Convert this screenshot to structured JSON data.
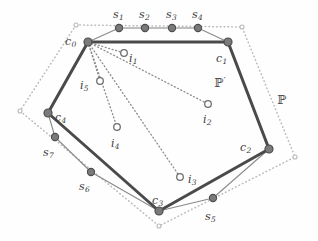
{
  "figure": {
    "colors": {
      "outer_polygon_dots": "#b9b9b9",
      "inner_polygon_stroke": "#4a4a4a",
      "thin_chain_stroke": "#8a8a8a",
      "vertex_fill": "#7a7a7a",
      "vertex_stroke": "#4d4d4d",
      "interior_point_stroke": "#6e6e6e",
      "interior_point_fill": "#ffffff",
      "dotted_link_stroke": "#8c8c8c",
      "label_color": "#3d3d3d",
      "background": "#fefefe"
    },
    "outer_polygon": {
      "name": "P",
      "label": "ℙ",
      "label_x": 277,
      "label_y": 94,
      "style": "dotted",
      "vertices": [
        {
          "x": 76,
          "y": 25
        },
        {
          "x": 242,
          "y": 27
        },
        {
          "x": 295,
          "y": 157
        },
        {
          "x": 159,
          "y": 226
        },
        {
          "x": 20,
          "y": 111
        }
      ]
    },
    "inner_polygon": {
      "name": "P-prime",
      "label": "ℙ",
      "label_prime": "′",
      "label_x": 214,
      "label_y": 76,
      "style": "solid-thick",
      "vertices": [
        {
          "id": "c0",
          "label": "c",
          "sub": "0",
          "x": 88,
          "y": 42,
          "label_x": 65,
          "label_y": 36
        },
        {
          "id": "c1",
          "label": "c",
          "sub": "1",
          "x": 228,
          "y": 42,
          "label_x": 216,
          "label_y": 53
        },
        {
          "id": "c2",
          "label": "c",
          "sub": "2",
          "x": 269,
          "y": 149,
          "label_x": 240,
          "label_y": 142
        },
        {
          "id": "c3",
          "label": "c",
          "sub": "3",
          "x": 159,
          "y": 211,
          "label_x": 152,
          "label_y": 195
        },
        {
          "id": "c4",
          "label": "c",
          "sub": "4",
          "x": 48,
          "y": 113,
          "label_x": 55,
          "label_y": 112
        }
      ]
    },
    "boundary_samples": [
      {
        "id": "s1",
        "label": "s",
        "sub": "1",
        "x": 119,
        "y": 28,
        "label_x": 113,
        "label_y": 9
      },
      {
        "id": "s2",
        "label": "s",
        "sub": "2",
        "x": 145,
        "y": 28,
        "label_x": 139,
        "label_y": 9
      },
      {
        "id": "s3",
        "label": "s",
        "sub": "3",
        "x": 172,
        "y": 28,
        "label_x": 166,
        "label_y": 9
      },
      {
        "id": "s4",
        "label": "s",
        "sub": "4",
        "x": 198,
        "y": 28,
        "label_x": 192,
        "label_y": 9
      },
      {
        "id": "s5",
        "label": "s",
        "sub": "5",
        "x": 213,
        "y": 198,
        "label_x": 205,
        "label_y": 211
      },
      {
        "id": "s6",
        "label": "s",
        "sub": "6",
        "x": 91,
        "y": 172,
        "label_x": 79,
        "label_y": 181
      },
      {
        "id": "s7",
        "label": "s",
        "sub": "7",
        "x": 55,
        "y": 137,
        "label_x": 43,
        "label_y": 147
      }
    ],
    "interior_points": [
      {
        "id": "i1",
        "label": "i",
        "sub": "1",
        "x": 124,
        "y": 53,
        "label_x": 129,
        "label_y": 53
      },
      {
        "id": "i2",
        "label": "i",
        "sub": "2",
        "x": 208,
        "y": 104,
        "label_x": 203,
        "label_y": 114
      },
      {
        "id": "i3",
        "label": "i",
        "sub": "3",
        "x": 180,
        "y": 177,
        "label_x": 188,
        "label_y": 174
      },
      {
        "id": "i4",
        "label": "i",
        "sub": "4",
        "x": 117,
        "y": 127,
        "label_x": 111,
        "label_y": 138
      },
      {
        "id": "i5",
        "label": "i",
        "sub": "5",
        "x": 100,
        "y": 81,
        "label_x": 80,
        "label_y": 80
      }
    ],
    "dotted_links": {
      "from": "c0",
      "to": [
        "i1",
        "i2",
        "i3",
        "i4",
        "i5"
      ]
    },
    "thin_chain": [
      {
        "from": "c0",
        "to": "s1"
      },
      {
        "from": "s1",
        "to": "s2"
      },
      {
        "from": "s2",
        "to": "s3"
      },
      {
        "from": "s3",
        "to": "s4"
      },
      {
        "from": "s4",
        "to": "c1"
      },
      {
        "from": "c2",
        "to": "s5"
      },
      {
        "from": "s5",
        "to": "c3"
      },
      {
        "from": "c4",
        "to": "s7"
      },
      {
        "from": "s7",
        "to": "s6"
      },
      {
        "from": "s6",
        "to": "c3"
      }
    ]
  }
}
